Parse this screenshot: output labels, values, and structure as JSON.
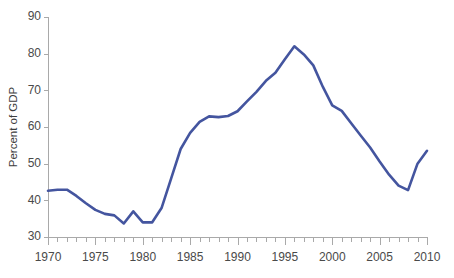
{
  "chart_data": {
    "type": "line",
    "title": "",
    "subtitle": "",
    "xlabel": "",
    "ylabel": "Percent of GDP",
    "xlim": [
      1970,
      2010
    ],
    "ylim": [
      30,
      90
    ],
    "y_ticks": [
      30,
      40,
      50,
      60,
      70,
      80,
      90
    ],
    "y_tick_labels": [
      "30",
      "40",
      "50",
      "60",
      "70",
      "80",
      "90"
    ],
    "x_ticks": [
      1970,
      1975,
      1980,
      1985,
      1990,
      1995,
      2000,
      2005,
      2010
    ],
    "x_tick_labels": [
      "1970",
      "1975",
      "1980",
      "1985",
      "1990",
      "1995",
      "2000",
      "2005",
      "2010"
    ],
    "x_minor_tick_step": 1,
    "grid": false,
    "legend": null,
    "legend_position": "none",
    "line_color": "#44559f",
    "axis_color": "#a9a9a9",
    "text_color": "#4a4a4a",
    "background_color": "#ffffff",
    "annotations": [],
    "series": [
      {
        "name": "Percent of GDP",
        "color": "#44559f",
        "x": [
          1970,
          1971,
          1972,
          1973,
          1974,
          1975,
          1976,
          1977,
          1978,
          1979,
          1980,
          1981,
          1982,
          1983,
          1984,
          1985,
          1986,
          1987,
          1988,
          1989,
          1990,
          1991,
          1992,
          1993,
          1994,
          1995,
          1996,
          1997,
          1998,
          1999,
          2000,
          2001,
          2002,
          2003,
          2004,
          2005,
          2006,
          2007,
          2008,
          2009,
          2010
        ],
        "values": [
          42.6,
          42.9,
          42.9,
          41.2,
          39.2,
          37.4,
          36.3,
          35.9,
          33.7,
          37.0,
          34.0,
          34.0,
          38.0,
          46.0,
          54.0,
          58.4,
          61.4,
          62.9,
          62.7,
          63.0,
          64.3,
          67.0,
          69.6,
          72.6,
          74.8,
          78.5,
          82.0,
          79.8,
          76.8,
          71.0,
          65.9,
          64.4,
          61.0,
          57.7,
          54.4,
          50.6,
          47.0,
          44.0,
          42.8,
          50.0,
          53.5
        ]
      }
    ]
  }
}
